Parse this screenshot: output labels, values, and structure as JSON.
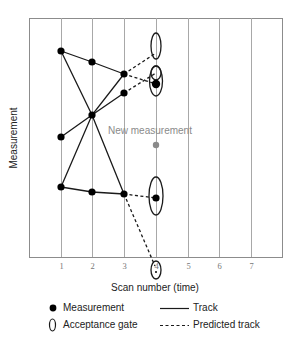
{
  "diagram": {
    "axes": {
      "x_title": "Scan number (time)",
      "y_title": "Measurement",
      "x_ticks": [
        "1",
        "2",
        "3",
        "4",
        "5",
        "6",
        "7"
      ]
    },
    "annotations": {
      "new_measurement": "New measurement"
    },
    "legend": {
      "measurement": "Measurement",
      "acceptance_gate": "Acceptance gate",
      "track": "Track",
      "predicted_track": "Predicted track"
    },
    "colors": {
      "frame": "#8c8c8c",
      "gridline": "#a8a8a8",
      "track": "#1a1a1a",
      "measurement": "#000000",
      "new_measurement": "#8a8a8a"
    },
    "measurements": [
      {
        "scan": 1,
        "label": "m1a"
      },
      {
        "scan": 1,
        "label": "m1b"
      },
      {
        "scan": 1,
        "label": "m1c"
      },
      {
        "scan": 2,
        "label": "m2a"
      },
      {
        "scan": 2,
        "label": "m2b"
      },
      {
        "scan": 2,
        "label": "m2c"
      },
      {
        "scan": 3,
        "label": "m3a"
      },
      {
        "scan": 3,
        "label": "m3b"
      },
      {
        "scan": 3,
        "label": "m3c"
      },
      {
        "scan": 4,
        "label": "m4a"
      },
      {
        "scan": 4,
        "label": "m4b"
      }
    ]
  }
}
